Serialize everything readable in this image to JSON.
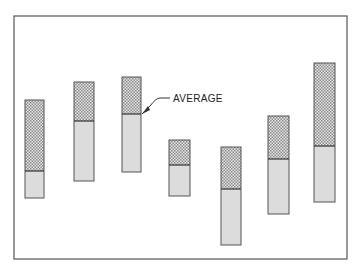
{
  "diagram": {
    "type": "range-bar",
    "annotation": {
      "label": "AVERAGE",
      "target_bar": 2
    },
    "colors": {
      "frame": "#555555",
      "upper_fill": "#c8c8c8",
      "lower_fill": "#dcdcdc",
      "outline": "#555555"
    },
    "frame": {
      "x": 14,
      "y": 16,
      "w": 333,
      "h": 243
    },
    "bars": [
      {
        "x": 25,
        "w": 19,
        "top": 100,
        "avg": 171,
        "bottom": 198
      },
      {
        "x": 74,
        "w": 20,
        "top": 82,
        "avg": 121,
        "bottom": 181
      },
      {
        "x": 122,
        "w": 19,
        "top": 77,
        "avg": 114,
        "bottom": 172
      },
      {
        "x": 169,
        "w": 21,
        "top": 140,
        "avg": 165,
        "bottom": 196
      },
      {
        "x": 221,
        "w": 20,
        "top": 147,
        "avg": 189,
        "bottom": 245
      },
      {
        "x": 268,
        "w": 21,
        "top": 116,
        "avg": 159,
        "bottom": 214
      },
      {
        "x": 314,
        "w": 21,
        "top": 63,
        "avg": 146,
        "bottom": 202
      }
    ]
  }
}
